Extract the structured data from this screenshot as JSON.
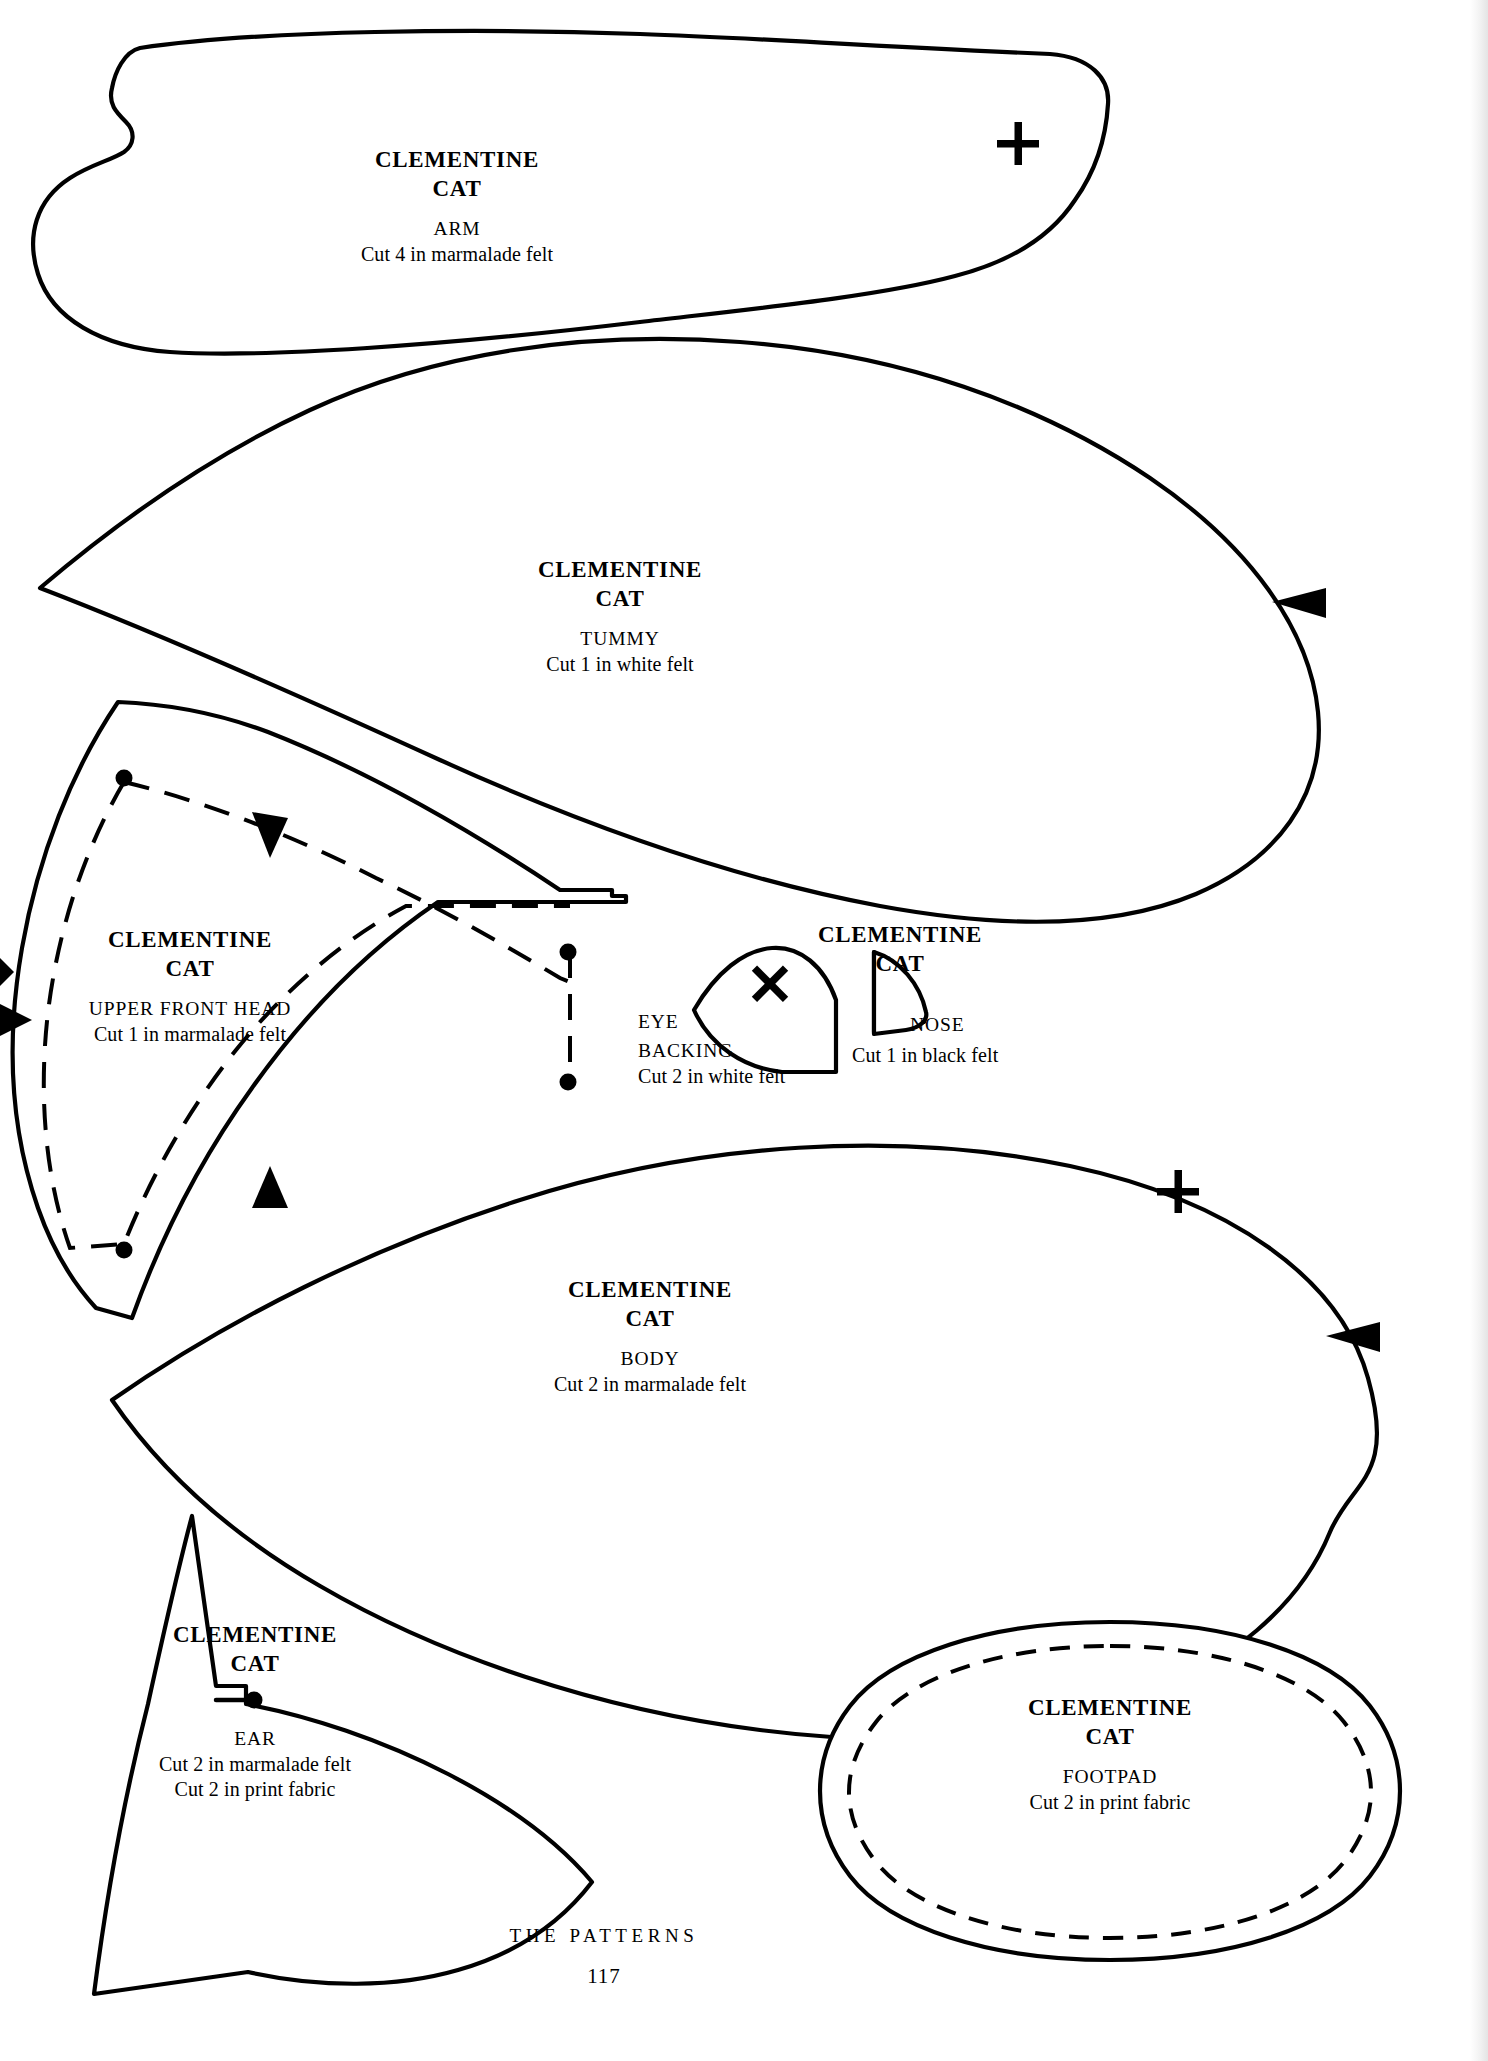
{
  "page": {
    "brand": "CLEMENTINE",
    "brand_line2": "CAT",
    "footer_section": "THE PATTERNS",
    "footer_page_number": "117",
    "ink_color": "#000000",
    "paper_color": "#ffffff"
  },
  "pieces": [
    {
      "id": "arm",
      "title_line1": "CLEMENTINE",
      "title_line2": "CAT",
      "part_name": "ARM",
      "cut_instructions": [
        "Cut 4 in marmalade felt"
      ],
      "marks": [
        "plus-mark"
      ]
    },
    {
      "id": "tummy",
      "title_line1": "CLEMENTINE",
      "title_line2": "CAT",
      "part_name": "TUMMY",
      "cut_instructions": [
        "Cut 1 in white felt"
      ],
      "marks": [
        "notch-arrow-right"
      ]
    },
    {
      "id": "upper-front-head",
      "title_line1": "CLEMENTINE",
      "title_line2": "CAT",
      "part_name": "UPPER FRONT HEAD",
      "cut_instructions": [
        "Cut 1 in marmalade felt"
      ],
      "marks": [
        "dashed-stitch-line",
        "dots",
        "notch-arrow-left",
        "notch-arrow-right"
      ]
    },
    {
      "id": "eye-backing",
      "title_line1": "",
      "title_line2": "",
      "part_name": "EYE\nBACKING",
      "part_name_line1": "EYE",
      "part_name_line2": "BACKING",
      "cut_instructions": [
        "Cut 2 in white felt"
      ],
      "marks": [
        "x-mark"
      ]
    },
    {
      "id": "nose",
      "title_line1": "CLEMENTINE",
      "title_line2": "CAT",
      "part_name": "NOSE",
      "cut_instructions": [
        "Cut 1 in black felt"
      ],
      "marks": []
    },
    {
      "id": "body",
      "title_line1": "CLEMENTINE",
      "title_line2": "CAT",
      "part_name": "BODY",
      "cut_instructions": [
        "Cut 2 in marmalade felt"
      ],
      "marks": [
        "plus-mark",
        "notch-arrow-right"
      ]
    },
    {
      "id": "ear",
      "title_line1": "CLEMENTINE",
      "title_line2": "CAT",
      "part_name": "EAR",
      "cut_instructions": [
        "Cut 2 in marmalade felt",
        "Cut 2 in print fabric"
      ],
      "marks": [
        "dot",
        "tick"
      ]
    },
    {
      "id": "footpad",
      "title_line1": "CLEMENTINE",
      "title_line2": "CAT",
      "part_name": "FOOTPAD",
      "cut_instructions": [
        "Cut 2 in print fabric"
      ],
      "marks": [
        "dashed-stitch-line"
      ]
    }
  ]
}
